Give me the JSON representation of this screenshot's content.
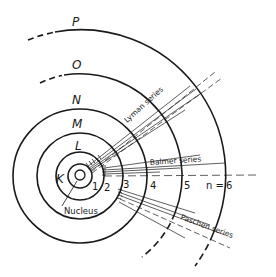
{
  "diagram": {
    "type": "bohr-atom-energy-levels",
    "colors": {
      "ink": "#1a1a1a",
      "background": "#ffffff"
    },
    "shells": [
      {
        "letter": "K",
        "n": "1"
      },
      {
        "letter": "L",
        "n": "2"
      },
      {
        "letter": "M",
        "n": "3"
      },
      {
        "letter": "N",
        "n": "4"
      },
      {
        "letter": "O",
        "n": "5"
      },
      {
        "letter": "P",
        "n": "6"
      }
    ],
    "n_prefix": "n =",
    "nucleus_label": "Nucleus",
    "series": [
      {
        "name": "Lyman series"
      },
      {
        "name": "Balmer series"
      },
      {
        "name": "Paschen series"
      }
    ]
  }
}
